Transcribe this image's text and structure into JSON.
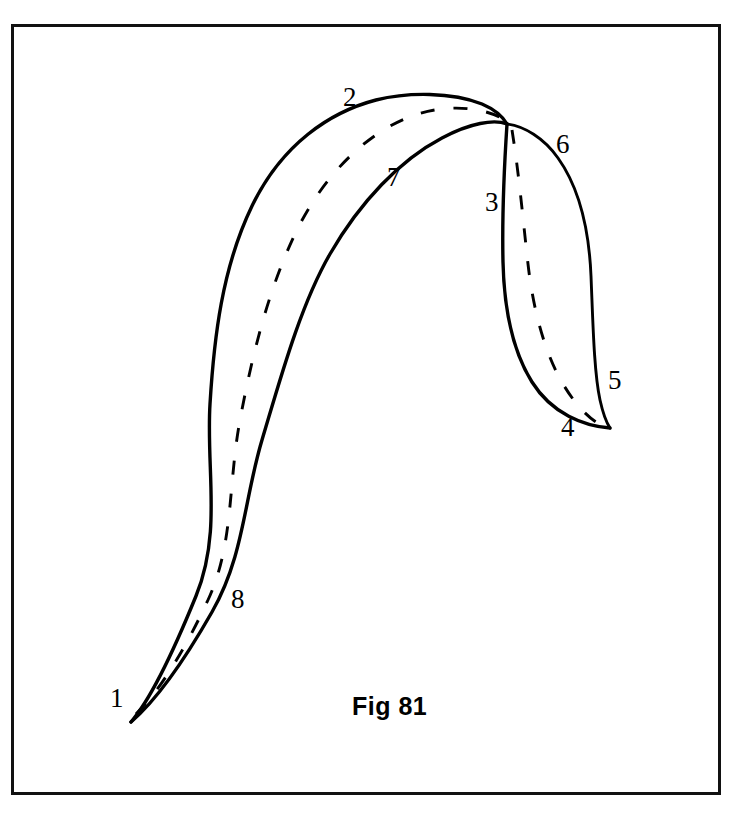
{
  "figure": {
    "caption": "Fig 81",
    "caption_x": 352,
    "caption_y": 692,
    "frame": {
      "x": 11,
      "y": 24,
      "width": 710,
      "height": 771,
      "stroke_color": "#111111",
      "stroke_width": 3
    },
    "canvas": {
      "width": 730,
      "height": 817,
      "background": "#ffffff"
    },
    "ink_color": "#000000"
  },
  "labels": [
    {
      "id": "label-1",
      "text": "1",
      "x": 110,
      "y": 685
    },
    {
      "id": "label-2",
      "text": "2",
      "x": 343,
      "y": 84
    },
    {
      "id": "label-3",
      "text": "3",
      "x": 485,
      "y": 189
    },
    {
      "id": "label-4",
      "text": "4",
      "x": 561,
      "y": 414
    },
    {
      "id": "label-5",
      "text": "5",
      "x": 608,
      "y": 367
    },
    {
      "id": "label-6",
      "text": "6",
      "x": 556,
      "y": 131
    },
    {
      "id": "label-7",
      "text": "7",
      "x": 387,
      "y": 164
    },
    {
      "id": "label-8",
      "text": "8",
      "x": 231,
      "y": 586
    }
  ],
  "chart_data": {
    "type": "diagram",
    "title": "Fig 81",
    "shapes": [
      {
        "name": "long-band",
        "tip_start": {
          "label": "1",
          "x": 131,
          "y": 722
        },
        "apex": {
          "label": "2",
          "x": 420,
          "y": 98
        },
        "outer_edge_labels": [
          "1",
          "2"
        ],
        "inner_edge_labels": [
          "8",
          "7"
        ],
        "midline_label": null
      },
      {
        "name": "short-band",
        "tip_end": {
          "label": "4",
          "x": 610,
          "y": 428
        },
        "apex": {
          "label": "3",
          "x": 505,
          "y": 124
        },
        "outer_edge_labels": [
          "6",
          "5"
        ],
        "inner_edge_labels": [
          "3",
          "4"
        ],
        "midline_label": null
      }
    ],
    "annotations": [
      {
        "numeral": "1",
        "position": "lower-left tip of long band"
      },
      {
        "numeral": "2",
        "position": "upper-left outer edge of long band apex"
      },
      {
        "numeral": "3",
        "position": "inner left edge of short band"
      },
      {
        "numeral": "4",
        "position": "lower tip, inner edge of short band"
      },
      {
        "numeral": "5",
        "position": "lower tip, outer edge of short band"
      },
      {
        "numeral": "6",
        "position": "upper-right outer edge of short band"
      },
      {
        "numeral": "7",
        "position": "inner upper edge of long band"
      },
      {
        "numeral": "8",
        "position": "inner lower edge of long band"
      }
    ]
  },
  "paths": {
    "long_band_outer": "M 131 722 C 150 700 170 660 196 596 C 222 532 206 470 210 404 C 214 338 222 268 252 206 C 282 144 330 112 376 100 C 408 92 452 92 482 104 C 496 110 503 117 507 124",
    "long_band_inner": "M 131 722 C 152 704 180 668 212 612 C 244 556 244 500 262 440 C 280 380 300 306 330 254 C 360 202 400 160 442 138 C 470 123 494 119 507 124",
    "long_band_midline": "M 136 714 C 158 692 182 656 208 600 C 234 544 228 484 240 420 C 252 356 268 290 296 232 C 324 174 368 132 412 116 C 444 104 482 106 505 120",
    "short_band_inner": "M 507 124 C 504 170 502 218 503 262 C 504 306 512 350 532 382 C 552 414 584 426 610 428",
    "short_band_outer": "M 507 124 C 524 126 544 138 558 158 C 578 186 589 228 591 276 C 593 324 594 372 600 400 C 604 418 608 425 610 428",
    "short_band_midline": "M 512 130 C 519 174 523 220 528 264 C 533 308 544 352 563 384 C 582 416 600 426 609 428"
  }
}
